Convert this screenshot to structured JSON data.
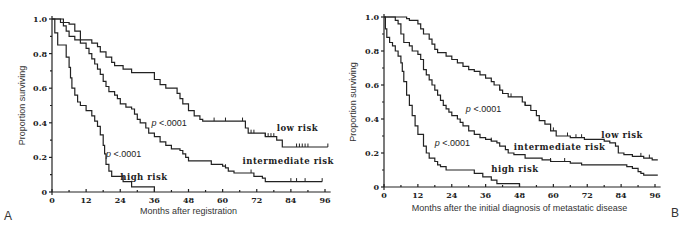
{
  "chart_data": [
    {
      "type": "line",
      "subtype": "kaplan-meier step",
      "panel": "A",
      "title": "",
      "xlabel": "Months after registration",
      "ylabel": "Proportion surviving",
      "xlim": [
        0,
        98
      ],
      "ylim": [
        0,
        1.0
      ],
      "xticks": [
        "0",
        "12",
        "24",
        "36",
        "48",
        "60",
        "72",
        "84",
        "96"
      ],
      "yticks": [
        "0",
        "0.2",
        "0.4",
        "0.6",
        "0.8",
        "1.0"
      ],
      "grid": false,
      "annotations": [
        {
          "text": "p <.0001",
          "x": 35,
          "y": 0.38
        },
        {
          "text": "p <.0001",
          "x": 19,
          "y": 0.2
        }
      ],
      "series": [
        {
          "name": "low risk",
          "label_pos": [
            79,
            0.35
          ],
          "points": [
            [
              0,
              1.0
            ],
            [
              3,
              1.0
            ],
            [
              4,
              0.98
            ],
            [
              6,
              0.97
            ],
            [
              8,
              0.93
            ],
            [
              10,
              0.88
            ],
            [
              14,
              0.86
            ],
            [
              16,
              0.84
            ],
            [
              17,
              0.81
            ],
            [
              19,
              0.78
            ],
            [
              21,
              0.75
            ],
            [
              22,
              0.73
            ],
            [
              25,
              0.71
            ],
            [
              28,
              0.69
            ],
            [
              34,
              0.69
            ],
            [
              36,
              0.65
            ],
            [
              38,
              0.62
            ],
            [
              40,
              0.6
            ],
            [
              44,
              0.57
            ],
            [
              45,
              0.54
            ],
            [
              46,
              0.51
            ],
            [
              48,
              0.47
            ],
            [
              50,
              0.44
            ],
            [
              52,
              0.42
            ],
            [
              53,
              0.41
            ],
            [
              67,
              0.41
            ],
            [
              68,
              0.37
            ],
            [
              69,
              0.34
            ],
            [
              74,
              0.34
            ],
            [
              75,
              0.32
            ],
            [
              78,
              0.32
            ],
            [
              79,
              0.3
            ],
            [
              81,
              0.26
            ],
            [
              97,
              0.26
            ]
          ],
          "censor_marks": [
            57,
            61,
            67,
            70,
            71,
            75,
            76,
            77,
            78,
            86,
            87,
            88,
            89,
            90,
            97
          ]
        },
        {
          "name": "intermediate risk",
          "label_pos": [
            67,
            0.16
          ],
          "points": [
            [
              0,
              1.0
            ],
            [
              2,
              1.0
            ],
            [
              3,
              0.98
            ],
            [
              4,
              0.96
            ],
            [
              5,
              0.93
            ],
            [
              6,
              0.9
            ],
            [
              8,
              0.88
            ],
            [
              10,
              0.86
            ],
            [
              12,
              0.83
            ],
            [
              13,
              0.8
            ],
            [
              14,
              0.77
            ],
            [
              15,
              0.74
            ],
            [
              16,
              0.71
            ],
            [
              17,
              0.68
            ],
            [
              18,
              0.64
            ],
            [
              19,
              0.61
            ],
            [
              20,
              0.58
            ],
            [
              22,
              0.56
            ],
            [
              23,
              0.54
            ],
            [
              24,
              0.51
            ],
            [
              26,
              0.49
            ],
            [
              28,
              0.48
            ],
            [
              29,
              0.45
            ],
            [
              30,
              0.42
            ],
            [
              31,
              0.4
            ],
            [
              33,
              0.37
            ],
            [
              34,
              0.34
            ],
            [
              36,
              0.32
            ],
            [
              38,
              0.29
            ],
            [
              40,
              0.27
            ],
            [
              42,
              0.25
            ],
            [
              45,
              0.24
            ],
            [
              46,
              0.22
            ],
            [
              47,
              0.2
            ],
            [
              48,
              0.18
            ],
            [
              54,
              0.18
            ],
            [
              56,
              0.16
            ],
            [
              60,
              0.15
            ],
            [
              61,
              0.14
            ],
            [
              62,
              0.12
            ],
            [
              64,
              0.11
            ],
            [
              70,
              0.11
            ],
            [
              71,
              0.09
            ],
            [
              74,
              0.08
            ],
            [
              75,
              0.06
            ],
            [
              95,
              0.06
            ]
          ],
          "censor_marks": [
            61,
            70,
            84,
            86,
            89,
            95
          ]
        },
        {
          "name": "high risk",
          "label_pos": [
            24,
            0.07
          ],
          "points": [
            [
              0,
              1.0
            ],
            [
              1,
              0.92
            ],
            [
              2,
              0.85
            ],
            [
              4,
              0.85
            ],
            [
              5,
              0.78
            ],
            [
              6,
              0.72
            ],
            [
              6.5,
              0.66
            ],
            [
              7,
              0.6
            ],
            [
              8,
              0.56
            ],
            [
              9,
              0.52
            ],
            [
              10,
              0.5
            ],
            [
              12,
              0.47
            ],
            [
              14,
              0.44
            ],
            [
              15,
              0.41
            ],
            [
              16,
              0.38
            ],
            [
              17,
              0.33
            ],
            [
              18,
              0.27
            ],
            [
              18.5,
              0.22
            ],
            [
              19,
              0.16
            ],
            [
              20,
              0.12
            ],
            [
              21,
              0.09
            ],
            [
              25,
              0.06
            ],
            [
              28,
              0.03
            ],
            [
              36,
              0.0
            ]
          ],
          "censor_marks": []
        }
      ]
    },
    {
      "type": "line",
      "subtype": "kaplan-meier step",
      "panel": "B",
      "title": "",
      "xlabel": "Months after the initial diagnosis of metastatic disease",
      "ylabel": "Proportion surviving",
      "xlim": [
        0,
        98
      ],
      "ylim": [
        0,
        1.0
      ],
      "xticks": [
        "0",
        "12",
        "24",
        "36",
        "48",
        "60",
        "72",
        "84",
        "96"
      ],
      "yticks": [
        "0",
        "0.2",
        "0.4",
        "0.6",
        "0.8",
        "1.0"
      ],
      "grid": false,
      "annotations": [
        {
          "text": "p <.0001",
          "x": 29,
          "y": 0.44
        },
        {
          "text": "p <.0001",
          "x": 18,
          "y": 0.24
        }
      ],
      "series": [
        {
          "name": "low risk",
          "label_pos": [
            77,
            0.29
          ],
          "points": [
            [
              0,
              1.0
            ],
            [
              5,
              1.0
            ],
            [
              8,
              0.99
            ],
            [
              9,
              0.98
            ],
            [
              12,
              0.96
            ],
            [
              13,
              0.93
            ],
            [
              14,
              0.9
            ],
            [
              16,
              0.87
            ],
            [
              17,
              0.84
            ],
            [
              18,
              0.81
            ],
            [
              19,
              0.79
            ],
            [
              22,
              0.77
            ],
            [
              24,
              0.75
            ],
            [
              26,
              0.73
            ],
            [
              28,
              0.71
            ],
            [
              30,
              0.69
            ],
            [
              32,
              0.68
            ],
            [
              34,
              0.66
            ],
            [
              36,
              0.64
            ],
            [
              38,
              0.62
            ],
            [
              39,
              0.6
            ],
            [
              41,
              0.57
            ],
            [
              42,
              0.55
            ],
            [
              44,
              0.53
            ],
            [
              48,
              0.53
            ],
            [
              49,
              0.5
            ],
            [
              50,
              0.48
            ],
            [
              52,
              0.45
            ],
            [
              54,
              0.42
            ],
            [
              55,
              0.39
            ],
            [
              57,
              0.37
            ],
            [
              59,
              0.33
            ],
            [
              61,
              0.3
            ],
            [
              66,
              0.29
            ],
            [
              71,
              0.28
            ],
            [
              78,
              0.27
            ],
            [
              80,
              0.26
            ],
            [
              82,
              0.24
            ],
            [
              83,
              0.2
            ],
            [
              85,
              0.19
            ],
            [
              88,
              0.18
            ],
            [
              92,
              0.17
            ],
            [
              95,
              0.16
            ],
            [
              97,
              0.16
            ]
          ],
          "censor_marks": [
            41,
            45,
            50,
            60,
            65,
            68,
            70,
            91,
            94
          ]
        },
        {
          "name": "intermediate risk",
          "label_pos": [
            46,
            0.22
          ],
          "points": [
            [
              0,
              1.0
            ],
            [
              2,
              1.0
            ],
            [
              4,
              0.98
            ],
            [
              5,
              0.96
            ],
            [
              6,
              0.9
            ],
            [
              7,
              0.85
            ],
            [
              9,
              0.83
            ],
            [
              10,
              0.8
            ],
            [
              12,
              0.78
            ],
            [
              13,
              0.75
            ],
            [
              14,
              0.69
            ],
            [
              15,
              0.66
            ],
            [
              16,
              0.63
            ],
            [
              17,
              0.6
            ],
            [
              18,
              0.57
            ],
            [
              19,
              0.54
            ],
            [
              20,
              0.51
            ],
            [
              21,
              0.48
            ],
            [
              22,
              0.46
            ],
            [
              23,
              0.44
            ],
            [
              24,
              0.42
            ],
            [
              26,
              0.4
            ],
            [
              27,
              0.38
            ],
            [
              28,
              0.36
            ],
            [
              30,
              0.33
            ],
            [
              32,
              0.31
            ],
            [
              34,
              0.29
            ],
            [
              36,
              0.28
            ],
            [
              38,
              0.27
            ],
            [
              40,
              0.26
            ],
            [
              41,
              0.24
            ],
            [
              43,
              0.22
            ],
            [
              44,
              0.2
            ],
            [
              46,
              0.19
            ],
            [
              50,
              0.17
            ],
            [
              56,
              0.16
            ],
            [
              59,
              0.15
            ],
            [
              66,
              0.14
            ],
            [
              70,
              0.13
            ],
            [
              84,
              0.13
            ],
            [
              86,
              0.12
            ],
            [
              88,
              0.11
            ],
            [
              90,
              0.09
            ],
            [
              91,
              0.08
            ],
            [
              92,
              0.07
            ],
            [
              97,
              0.07
            ]
          ],
          "censor_marks": [
            38,
            59,
            64
          ]
        },
        {
          "name": "high risk",
          "label_pos": [
            38,
            0.09
          ],
          "points": [
            [
              0,
              1.0
            ],
            [
              0.5,
              0.93
            ],
            [
              1,
              0.88
            ],
            [
              2,
              0.85
            ],
            [
              3,
              0.83
            ],
            [
              4,
              0.8
            ],
            [
              5,
              0.77
            ],
            [
              6,
              0.73
            ],
            [
              6.5,
              0.68
            ],
            [
              7,
              0.62
            ],
            [
              8,
              0.54
            ],
            [
              9,
              0.48
            ],
            [
              10,
              0.42
            ],
            [
              11,
              0.36
            ],
            [
              12,
              0.31
            ],
            [
              14,
              0.24
            ],
            [
              15,
              0.2
            ],
            [
              16,
              0.17
            ],
            [
              18,
              0.15
            ],
            [
              19,
              0.13
            ],
            [
              20,
              0.12
            ],
            [
              22,
              0.1
            ],
            [
              28,
              0.1
            ],
            [
              32,
              0.08
            ],
            [
              35,
              0.06
            ],
            [
              38,
              0.04
            ],
            [
              40,
              0.02
            ],
            [
              48,
              0.0
            ]
          ],
          "censor_marks": []
        }
      ]
    }
  ]
}
